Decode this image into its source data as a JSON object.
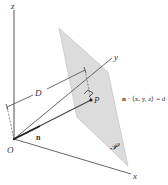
{
  "diagram": {
    "type": "3d-geometry",
    "axes": {
      "z": {
        "label": "z"
      },
      "y": {
        "label": "y"
      },
      "x": {
        "label": "x"
      }
    },
    "labels": {
      "origin": "O",
      "point": "P",
      "normal": "n",
      "distance": "D",
      "plane": "𝒫",
      "equation": "n · ⟨x, y, z⟩ = d"
    },
    "equation_parts": {
      "vector": "n",
      "rest": " · ⟨x, y, z⟩ = d"
    },
    "colors": {
      "plane_fill": "#dcdcdc",
      "plane_stroke": "#b0b0b0",
      "line": "#444444",
      "background": "#ffffff"
    }
  }
}
